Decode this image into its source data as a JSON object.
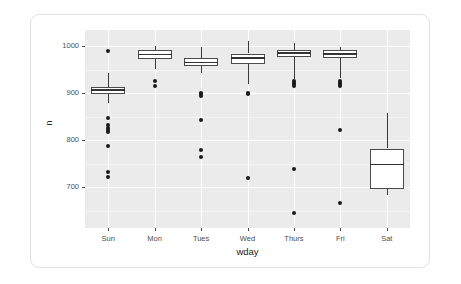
{
  "chart_data": {
    "type": "boxplot",
    "title": "",
    "xlabel": "wday",
    "ylabel": "n",
    "categories": [
      "Sun",
      "Mon",
      "Tues",
      "Wed",
      "Thurs",
      "Fri",
      "Sat"
    ],
    "ytick_labels": [
      "700",
      "800",
      "900",
      "1000"
    ],
    "ytick_values": [
      700,
      800,
      900,
      1000
    ],
    "ylim": [
      620,
      1035
    ],
    "grid": true,
    "legend": "none",
    "panel_background": "#ebebeb",
    "gridline_color": "#ffffff",
    "box_fill": "#ffffff",
    "box_stroke": "#4a4a4a",
    "outlier_color": "#1a1a1a",
    "boxes": [
      {
        "category": "Sun",
        "lower_whisker": 878,
        "q1": 897,
        "median": 906,
        "q3": 913,
        "upper_whisker": 942,
        "outliers": [
          990,
          846,
          833,
          826,
          821,
          817,
          788,
          731,
          722
        ]
      },
      {
        "category": "Mon",
        "lower_whisker": 950,
        "q1": 973,
        "median": 982,
        "q3": 991,
        "upper_whisker": 1001,
        "outliers": [
          925,
          915
        ]
      },
      {
        "category": "Tues",
        "lower_whisker": 943,
        "q1": 957,
        "median": 965,
        "q3": 975,
        "upper_whisker": 998,
        "outliers": [
          900,
          897,
          894,
          843,
          778,
          764
        ]
      },
      {
        "category": "Wed",
        "lower_whisker": 919,
        "q1": 962,
        "median": 974,
        "q3": 984,
        "upper_whisker": 1011,
        "outliers": [
          901,
          899,
          720
        ]
      },
      {
        "category": "Thurs",
        "lower_whisker": 930,
        "q1": 976,
        "median": 985,
        "q3": 992,
        "upper_whisker": 1007,
        "outliers": [
          925,
          922,
          919,
          916,
          738,
          645
        ]
      },
      {
        "category": "Fri",
        "lower_whisker": 932,
        "q1": 975,
        "median": 983,
        "q3": 991,
        "upper_whisker": 999,
        "outliers": [
          926,
          922,
          919,
          916,
          822,
          665
        ]
      },
      {
        "category": "Sat",
        "lower_whisker": 682,
        "q1": 695,
        "median": 748,
        "q3": 782,
        "upper_whisker": 858,
        "outliers": []
      }
    ]
  }
}
